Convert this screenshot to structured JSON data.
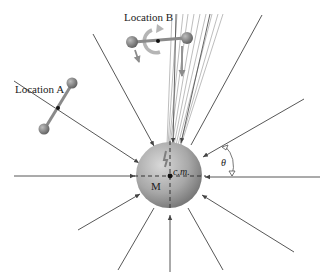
{
  "figure": {
    "labels": {
      "location_a": "Location A",
      "location_b": "Location B",
      "center_of_mass": "c.m.",
      "mass": "M",
      "angle": "θ"
    },
    "colors": {
      "line": "#444444",
      "fan_line": "#9a9a9a",
      "sphere_light": "#d2d2d2",
      "sphere_dark": "#7a7a7a",
      "dumbbell": "#777777",
      "rotation_arrow": "#b0b0b0"
    },
    "sphere": {
      "cx": 169,
      "cy": 175,
      "r": 33
    }
  }
}
